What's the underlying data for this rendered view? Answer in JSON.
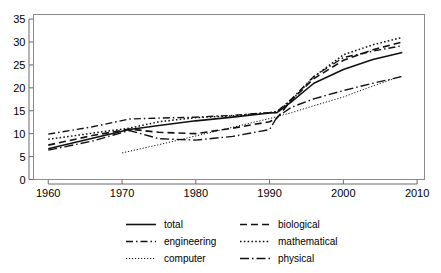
{
  "chart_data": {
    "type": "line",
    "title": "",
    "subtitle": "",
    "xlabel": "",
    "ylabel": "",
    "xlim": [
      1958,
      2011
    ],
    "ylim": [
      0,
      36
    ],
    "xticks": [
      1960,
      1970,
      1980,
      1990,
      2000,
      2010
    ],
    "yticks": [
      0,
      5,
      10,
      15,
      20,
      25,
      30,
      35
    ],
    "xtick_labels": [
      "1960",
      "1970",
      "1980",
      "1990",
      "2000",
      "2010"
    ],
    "ytick_labels": [
      "0",
      "5",
      "10",
      "15",
      "20",
      "25",
      "30",
      "35"
    ],
    "grid": false,
    "legend_position": "below",
    "series": [
      {
        "name": "total",
        "label": "total",
        "style": "solid",
        "x": [
          1960,
          1966,
          1971,
          1975,
          1980,
          1985,
          1990,
          1991,
          1993,
          1996,
          2000,
          2004,
          2008
        ],
        "values": [
          6.7,
          9.0,
          10.9,
          11.8,
          12.8,
          13.6,
          14.5,
          14.6,
          17.0,
          21.0,
          24.0,
          26.2,
          27.7
        ]
      },
      {
        "name": "biological",
        "label": "biological",
        "style": "dashed",
        "x": [
          1960,
          1966,
          1971,
          1975,
          1980,
          1985,
          1990,
          1991,
          1993,
          1996,
          2000,
          2004,
          2008
        ],
        "values": [
          7.5,
          9.6,
          11.0,
          10.3,
          10.0,
          11.2,
          12.6,
          13.4,
          17.4,
          22.0,
          26.0,
          28.3,
          30.0
        ]
      },
      {
        "name": "engineering",
        "label": "engineering",
        "style": "dashdot",
        "x": [
          1960,
          1966,
          1971,
          1975,
          1980,
          1985,
          1990,
          1991,
          1993,
          1996,
          2000,
          2004,
          2008
        ],
        "values": [
          9.9,
          11.5,
          13.2,
          13.4,
          13.6,
          14.0,
          14.6,
          14.8,
          17.6,
          22.5,
          26.6,
          28.0,
          29.2
        ]
      },
      {
        "name": "mathematical",
        "label": "mathematical",
        "style": "dotted",
        "x": [
          1960,
          1966,
          1971,
          1975,
          1980,
          1985,
          1990,
          1991,
          1993,
          1996,
          2000,
          2004,
          2008
        ],
        "values": [
          8.8,
          10.1,
          11.2,
          12.6,
          13.5,
          13.9,
          14.6,
          14.8,
          17.3,
          22.4,
          27.2,
          29.4,
          31.0
        ]
      },
      {
        "name": "computer",
        "label": "computer",
        "style": "fine-dotted",
        "x": [
          1970,
          1975,
          1980,
          1985,
          1990,
          1993,
          1996,
          2000,
          2004,
          2008
        ],
        "values": [
          5.8,
          7.6,
          9.5,
          11.4,
          13.3,
          14.6,
          16.1,
          18.0,
          20.4,
          22.6
        ]
      },
      {
        "name": "physical",
        "label": "physical",
        "style": "dashdot-long",
        "x": [
          1960,
          1966,
          1971,
          1975,
          1980,
          1985,
          1990,
          1991,
          1993,
          1996,
          2000,
          2004,
          2008
        ],
        "values": [
          6.4,
          8.4,
          10.7,
          8.9,
          8.6,
          9.4,
          10.9,
          13.6,
          15.8,
          17.6,
          19.4,
          21.0,
          22.5
        ]
      }
    ],
    "legend": [
      {
        "label": "total",
        "style": "solid"
      },
      {
        "label": "biological",
        "style": "dashed"
      },
      {
        "label": "engineering",
        "style": "dashdot"
      },
      {
        "label": "mathematical",
        "style": "dotted"
      },
      {
        "label": "computer",
        "style": "fine-dotted"
      },
      {
        "label": "physical",
        "style": "dashdot-long"
      }
    ],
    "colors": {
      "line": "#111111",
      "axis": "#6b6b6b",
      "frame": "#8a8a8a",
      "text": "#000000",
      "background": "#ffffff"
    }
  }
}
